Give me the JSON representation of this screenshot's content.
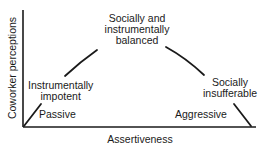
{
  "diagram": {
    "type": "inverted-U curve",
    "y_axis_label": "Coworker perceptions",
    "x_axis_label": "Assertiveness",
    "regions": [
      {
        "label_line1": "Instrumentally",
        "label_line2": "impotent",
        "position": "left"
      },
      {
        "label_line1": "Socially and",
        "label_line2": "instrumentally",
        "label_line3": "balanced",
        "position": "top-center"
      },
      {
        "label_line1": "Socially",
        "label_line2": "insufferable",
        "position": "right"
      }
    ],
    "endpoints": {
      "low": "Passive",
      "high": "Aggressive"
    },
    "colors": {
      "line": "#1a1a1a",
      "text": "#1a1a1a",
      "background": "#ffffff"
    }
  }
}
